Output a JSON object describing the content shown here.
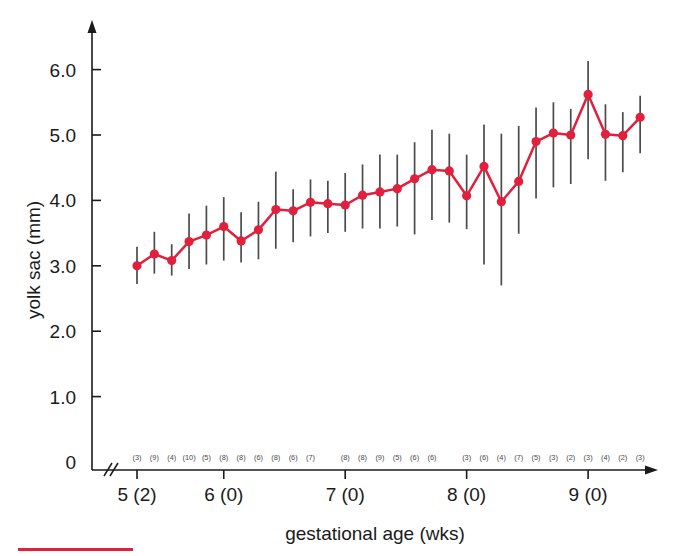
{
  "figure": {
    "background_color": "#ffffff",
    "series_color": "#e0203c",
    "errorbar_color": "#4b4b4b",
    "axis_color": "#1a1a1a"
  },
  "axes": {
    "y_title": "yolk sac (mm)",
    "x_title": "gestational age (wks)",
    "y_ticks": [
      "0",
      "1.0",
      "2.0",
      "3.0",
      "4.0",
      "5.0",
      "6.0"
    ],
    "x_major_ticks": [
      "5 (2)",
      "6 (0)",
      "7 (0)",
      "8 (0)",
      "9 (0)"
    ],
    "x_axis_break": "//",
    "y_axis_break": "//"
  },
  "chart_data": {
    "type": "line",
    "title": "",
    "xlabel": "gestational age (wks)",
    "ylabel": "yolk sac (mm)",
    "ylim": [
      0,
      6.5
    ],
    "grid": false,
    "legend": "none",
    "x_tick_labels": [
      "5 (2)",
      "6 (0)",
      "7 (0)",
      "8 (0)",
      "9 (0)"
    ],
    "x_tick_weeks": [
      5.2,
      6.0,
      7.0,
      8.0,
      9.0
    ],
    "x_unit": "weeks (days)",
    "y_unit": "mm",
    "x": [
      5.2,
      5.3,
      5.4,
      5.5,
      5.6,
      6.0,
      6.1,
      6.2,
      6.3,
      6.4,
      6.5,
      6.6,
      7.0,
      7.1,
      7.2,
      7.3,
      7.4,
      7.5,
      7.6,
      8.0,
      8.1,
      8.2,
      8.3,
      8.4,
      8.5,
      8.6,
      9.0,
      9.1,
      9.2,
      9.3
    ],
    "values": [
      3.0,
      3.18,
      3.08,
      3.37,
      3.47,
      3.6,
      3.38,
      3.55,
      3.86,
      3.84,
      3.97,
      3.95,
      3.93,
      4.08,
      4.13,
      4.18,
      4.33,
      4.47,
      4.45,
      4.07,
      4.52,
      3.98,
      4.29,
      4.9,
      5.03,
      5.0,
      5.62,
      5.01,
      4.99,
      5.27
    ],
    "errorbar_lower": [
      2.72,
      2.88,
      2.85,
      2.95,
      3.02,
      3.08,
      3.05,
      3.1,
      3.26,
      3.36,
      3.45,
      3.5,
      3.52,
      3.57,
      3.57,
      3.6,
      3.48,
      3.7,
      3.66,
      3.56,
      3.02,
      2.7,
      3.49,
      4.03,
      4.2,
      4.25,
      4.63,
      4.3,
      4.43,
      4.72
    ],
    "errorbar_upper": [
      3.29,
      3.52,
      3.33,
      3.8,
      3.92,
      4.05,
      3.82,
      3.98,
      4.44,
      4.17,
      4.32,
      4.3,
      4.42,
      4.55,
      4.7,
      4.7,
      4.89,
      5.08,
      5.02,
      4.7,
      5.16,
      5.02,
      5.14,
      5.42,
      5.5,
      5.4,
      6.13,
      5.47,
      5.35,
      5.6
    ],
    "sample_sizes": [
      3,
      9,
      4,
      10,
      5,
      8,
      8,
      6,
      8,
      6,
      7,
      8,
      8,
      9,
      5,
      6,
      6,
      3,
      6,
      4,
      7,
      5,
      3,
      2,
      3,
      4,
      2,
      3
    ],
    "sample_size_labels": [
      "(3)",
      "(9)",
      "(4)",
      "(10)",
      "(5)",
      "(8)",
      "(8)",
      "(6)",
      "(8)",
      "(6)",
      "(7)",
      "(8)",
      "(8)",
      "(9)",
      "(5)",
      "(6)",
      "(6)",
      "(3)",
      "(6)",
      "(4)",
      "(7)",
      "(5)",
      "(3)",
      "(2)",
      "(3)",
      "(4)",
      "(2)",
      "(3)"
    ]
  }
}
